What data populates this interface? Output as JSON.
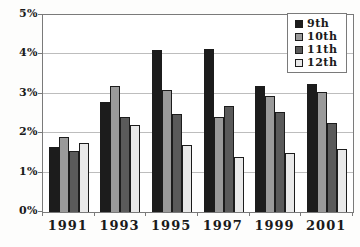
{
  "chart_data": {
    "type": "bar",
    "title": "",
    "xlabel": "",
    "ylabel": "",
    "categories": [
      "1991",
      "1993",
      "1995",
      "1997",
      "1999",
      "2001"
    ],
    "series": [
      {
        "name": "9th",
        "color": "#1c1c1c",
        "values": [
          1.65,
          2.8,
          4.1,
          4.15,
          3.2,
          3.25
        ]
      },
      {
        "name": "10th",
        "color": "#9a9a9a",
        "values": [
          1.9,
          3.2,
          3.1,
          2.4,
          2.95,
          3.05
        ]
      },
      {
        "name": "11th",
        "color": "#5a5a5a",
        "values": [
          1.55,
          2.4,
          2.5,
          2.7,
          2.55,
          2.25
        ]
      },
      {
        "name": "12th",
        "color": "#e9e9e9",
        "values": [
          1.75,
          2.2,
          1.7,
          1.4,
          1.5,
          1.6
        ]
      }
    ],
    "ylim": [
      0,
      5
    ],
    "y_tick_labels": [
      "0%",
      "1%",
      "2%",
      "3%",
      "4%",
      "5%"
    ],
    "grid": true,
    "legend_position": "top-right",
    "colors": {
      "bar_border": "#1c1c1c",
      "gridline": "#bdbdbd",
      "axis": "#7a7a7a",
      "text": "#1a1a1a",
      "plot_background": "#ffffff"
    }
  }
}
